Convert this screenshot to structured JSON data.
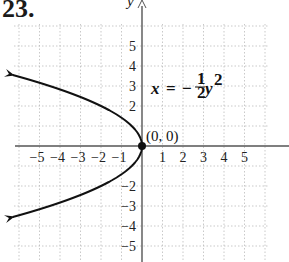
{
  "problem_number": "23.",
  "chart_data": {
    "type": "line",
    "title": "",
    "equation": "x = -½y²",
    "equation_parts": {
      "lhs": "x",
      "eq": "=",
      "sign": "−",
      "num": "1",
      "den": "2",
      "var": "y",
      "exp": "2"
    },
    "xlabel": "",
    "ylabel": "y",
    "xlim": [
      -6,
      6
    ],
    "ylim": [
      -6,
      6
    ],
    "grid": true,
    "x_ticks": [
      -5,
      -4,
      -3,
      -2,
      -1,
      1,
      2,
      3,
      4,
      5
    ],
    "y_ticks": [
      5,
      4,
      3,
      2,
      -2,
      -3,
      -4,
      -5
    ],
    "x_tick_labels": [
      "−5",
      "−4",
      "−3",
      "−2",
      "−1",
      "1",
      "2",
      "3",
      "4",
      "5"
    ],
    "y_tick_labels": [
      "5",
      "4",
      "3",
      "2",
      "3",
      "−2",
      "−3",
      "−4",
      "−5"
    ],
    "series": [
      {
        "name": "x = -1/2 y^2",
        "points": [
          [
            -6.1,
            3.5
          ],
          [
            -4.5,
            3
          ],
          [
            -2,
            2
          ],
          [
            -0.5,
            1
          ],
          [
            0,
            0
          ],
          [
            -0.5,
            -1
          ],
          [
            -2,
            -2
          ],
          [
            -4.5,
            -3
          ],
          [
            -6.1,
            -3.5
          ]
        ],
        "arrows": "both"
      }
    ],
    "annotations": [
      {
        "text": "(0, 0)",
        "x": 0,
        "y": 0,
        "marker": "filled-dot"
      }
    ]
  }
}
